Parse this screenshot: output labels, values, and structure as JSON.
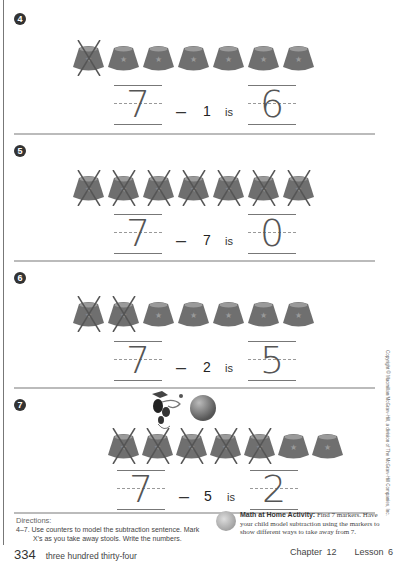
{
  "page": {
    "page_number": "334",
    "page_words": "three hundred thirty-four",
    "chapter": "Chapter 12",
    "lesson": "Lesson 6",
    "copyright": "Copyright © Macmillan/McGraw-Hill, a division of The McGraw-Hill Companies, Inc."
  },
  "problems": [
    {
      "number": "4",
      "total": "7",
      "minus_sign": "–",
      "subtract": "1",
      "is_label": "is",
      "result": "6",
      "stools": 7,
      "crossed": 1
    },
    {
      "number": "5",
      "total": "7",
      "minus_sign": "–",
      "subtract": "7",
      "is_label": "is",
      "result": "0",
      "stools": 7,
      "crossed": 7
    },
    {
      "number": "6",
      "total": "7",
      "minus_sign": "–",
      "subtract": "2",
      "is_label": "is",
      "result": "5",
      "stools": 7,
      "crossed": 2
    },
    {
      "number": "7",
      "total": "7",
      "minus_sign": "–",
      "subtract": "5",
      "is_label": "is",
      "result": "2",
      "stools": 7,
      "crossed": 5
    }
  ],
  "directions": {
    "title": "Directions:",
    "line1": "4–7.  Use counters to model the subtraction sentence. Mark",
    "line2": "X's as you take away stools. Write the numbers."
  },
  "home_activity": {
    "title": "Math at Home Activity:",
    "text": "Find 7 markers. Have your child model subtraction using the markers to show different ways to take away from 7."
  },
  "colors": {
    "stool_body": "#6f6f6f",
    "stool_top": "#9a9a9a",
    "x_mark": "#555555",
    "rule": "#bbbbbb"
  }
}
